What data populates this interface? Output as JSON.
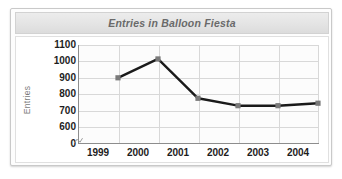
{
  "card": {
    "title": "Entries in Balloon Fiesta"
  },
  "chart_data": {
    "type": "line",
    "title": "Entries in Balloon Fiesta",
    "xlabel": "",
    "ylabel": "Entries",
    "categories": [
      "1999",
      "2000",
      "2001",
      "2002",
      "2003",
      "2004"
    ],
    "values": [
      900,
      1015,
      775,
      730,
      730,
      745
    ],
    "series": [
      {
        "name": "Entries",
        "values": [
          900,
          1015,
          775,
          730,
          730,
          745
        ]
      }
    ],
    "ytick_labels": [
      "1100",
      "1000",
      "900",
      "800",
      "700",
      "600",
      "0"
    ],
    "ytick_values": [
      1100,
      1000,
      900,
      800,
      700,
      600,
      0
    ],
    "ylim": [
      600,
      1100
    ],
    "axis_break": true,
    "grid": true,
    "legend": "none",
    "line_color": "#1a1a1a",
    "marker_color": "#7a7a7a",
    "grid_color": "#d8d8d8",
    "axis_color": "#8d8d8d",
    "title_color": "#6a6a6a",
    "tick_color": "#1d1d1d",
    "axis_label_color": "#7b7b7b"
  }
}
